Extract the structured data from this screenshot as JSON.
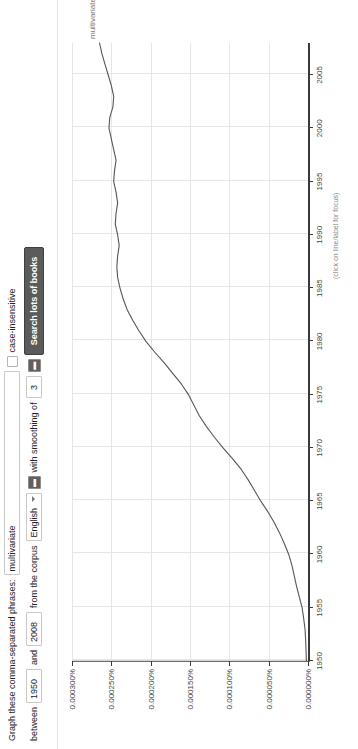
{
  "form": {
    "graph_label": "Graph these comma-separated phrases:",
    "phrases_value": "multivariate",
    "phrases_placeholder": "",
    "between_label": "between",
    "start_year": "1950",
    "and_label": "and",
    "end_year": "2008",
    "corpus_label": "from the corpus",
    "corpus_value": "English",
    "smoothing_label": "with smoothing of",
    "smoothing_value": "3",
    "stepper_down": "▬",
    "stepper_up": "▬",
    "case_insensitive_label": "case-insensitive",
    "case_insensitive_checked": false,
    "search_button_label": "Search lots of books"
  },
  "chart": {
    "series_label": "multivariate",
    "focus_hint": "(click on line/label for focus)"
  },
  "chart_data": {
    "type": "line",
    "title": "",
    "xlabel": "",
    "ylabel": "",
    "xlim": [
      1950,
      2008
    ],
    "ylim": [
      0.0,
      0.0003
    ],
    "grid": true,
    "legend": "inline-end-label",
    "xticks": [
      "1950",
      "1955",
      "1960",
      "1965",
      "1970",
      "1975",
      "1980",
      "1985",
      "1990",
      "1995",
      "2000",
      "2005"
    ],
    "yticks": [
      "0.000000%",
      "0.000050%",
      "0.000100%",
      "0.000150%",
      "0.000200%",
      "0.000250%",
      "0.000300%"
    ],
    "ytick_values": [
      0.0,
      5e-05,
      0.0001,
      0.00015,
      0.0002,
      0.00025,
      0.0003
    ],
    "series": [
      {
        "name": "multivariate",
        "color": "#555555",
        "x": [
          1950,
          1951,
          1952,
          1953,
          1954,
          1955,
          1956,
          1957,
          1958,
          1959,
          1960,
          1961,
          1962,
          1963,
          1964,
          1965,
          1966,
          1967,
          1968,
          1969,
          1970,
          1971,
          1972,
          1973,
          1974,
          1975,
          1976,
          1977,
          1978,
          1979,
          1980,
          1981,
          1982,
          1983,
          1984,
          1985,
          1986,
          1987,
          1988,
          1989,
          1990,
          1991,
          1992,
          1993,
          1994,
          1995,
          1996,
          1997,
          1998,
          1999,
          2000,
          2001,
          2002,
          2003,
          2004,
          2005,
          2006,
          2007,
          2008
        ],
        "values": [
          2e-06,
          2.5e-06,
          3e-06,
          3.8e-06,
          5.5e-06,
          7.5e-06,
          1.1e-05,
          1.45e-05,
          1.75e-05,
          2.05e-05,
          2.45e-05,
          3e-05,
          3.6e-05,
          4.3e-05,
          5.1e-05,
          6e-05,
          6.8e-05,
          7.6e-05,
          8.5e-05,
          9.6e-05,
          0.000108,
          0.000119,
          0.000129,
          0.000138,
          0.000145,
          0.000152,
          0.000161,
          0.000172,
          0.000183,
          0.000195,
          0.000206,
          0.000215,
          0.000223,
          0.00023,
          0.000235,
          0.000239,
          0.000242,
          0.000243,
          0.000242,
          0.00024,
          0.000242,
          0.000245,
          0.000244,
          0.000242,
          0.000244,
          0.000247,
          0.000246,
          0.000244,
          0.000247,
          0.00025,
          0.000253,
          0.000252,
          0.000248,
          0.000247,
          0.00025,
          0.000254,
          0.000258,
          0.000262,
          0.000265
        ]
      }
    ]
  }
}
